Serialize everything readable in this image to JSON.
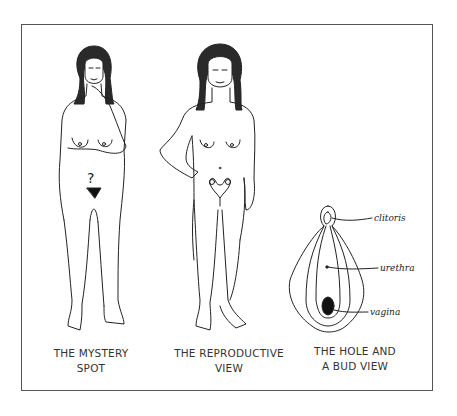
{
  "figure": {
    "panels": [
      {
        "id": "mystery-spot",
        "caption_line1": "THE MYSTERY",
        "caption_line2": "SPOT",
        "marker": "?"
      },
      {
        "id": "reproductive-view",
        "caption_line1": "THE REPRODUCTIVE",
        "caption_line2": "VIEW"
      },
      {
        "id": "hole-and-bud-view",
        "caption_line1": "THE HOLE AND",
        "caption_line2": "A BUD VIEW",
        "labels": [
          "clitoris",
          "urethra",
          "vagina"
        ]
      }
    ],
    "colors": {
      "line": "#222222",
      "frame": "#555555",
      "background": "#ffffff",
      "fill_dark": "#111111"
    }
  }
}
